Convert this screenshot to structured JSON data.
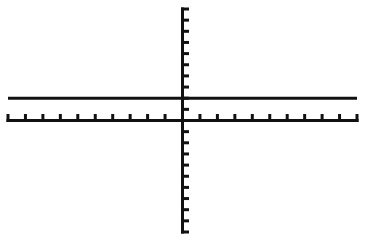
{
  "chart_data": {
    "type": "line",
    "title": "",
    "xlabel": "",
    "ylabel": "",
    "xlim": [
      -10,
      10
    ],
    "ylim": [
      -10,
      10
    ],
    "xscale": 1,
    "yscale": 1,
    "grid": false,
    "legend": null,
    "series": [
      {
        "name": "y=2",
        "x": [
          -10,
          10
        ],
        "values": [
          2,
          2
        ]
      }
    ],
    "tick_labels": false
  },
  "colors": {
    "background": "#ffffff",
    "axis": "#111111",
    "plot": "#111111"
  },
  "layout": {
    "plot_left": 8,
    "plot_right": 357,
    "plot_top": 9,
    "plot_bottom": 232,
    "origin_x": 182,
    "origin_y": 118
  }
}
